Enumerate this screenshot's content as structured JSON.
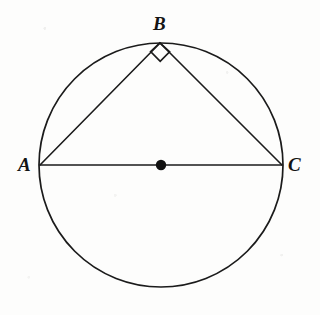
{
  "figure": {
    "background_color": "#fdfdfc",
    "stroke_color": "#1b1b1b",
    "center_dot_color": "#111111",
    "labels": {
      "a": "A",
      "b": "B",
      "c": "C"
    },
    "geometry": {
      "circle": {
        "cx": 161,
        "cy": 165,
        "r": 122
      },
      "points": {
        "A": {
          "x": 40,
          "y": 165
        },
        "B": {
          "x": 160,
          "y": 43
        },
        "C": {
          "x": 282,
          "y": 165
        },
        "O": {
          "x": 161,
          "y": 165
        }
      },
      "center_dot_radius": 5.2,
      "segments": [
        {
          "name": "diameter-AC",
          "from": "A",
          "to": "C"
        },
        {
          "name": "chord-AB",
          "from": "A",
          "to": "B"
        },
        {
          "name": "chord-BC",
          "from": "B",
          "to": "C"
        }
      ],
      "right_angle_marker": {
        "at_vertex": "B",
        "shape": "square",
        "size": 15,
        "path": "M 150.6 51.6 L 159.9 42.8 L 169.6 51.8 L 160.2 61.3 Z"
      }
    }
  }
}
